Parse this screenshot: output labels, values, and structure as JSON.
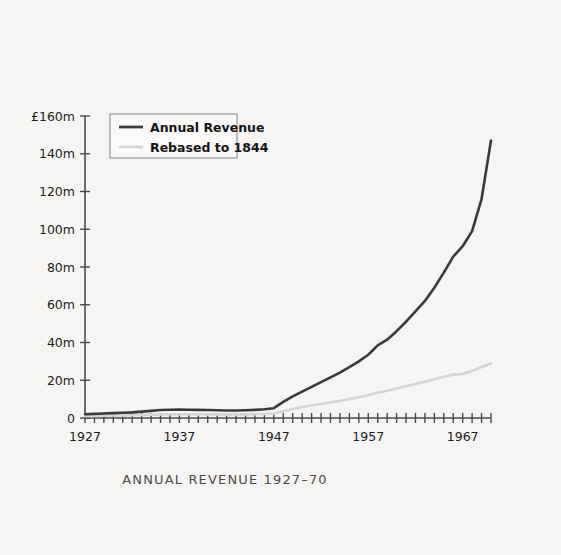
{
  "chart_data": {
    "type": "line",
    "title": "ANNUAL REVENUE 1927–70",
    "xlabel": "",
    "ylabel": "",
    "ylim": [
      0,
      160
    ],
    "xlim": [
      1927,
      1970
    ],
    "grid": false,
    "legend_position": "top-left",
    "y_unit": "£m",
    "y_ticks": [
      0,
      20,
      40,
      60,
      80,
      100,
      120,
      140,
      160
    ],
    "y_tick_labels": [
      "0",
      "20m",
      "40m",
      "60m",
      "80m",
      "100m",
      "120m",
      "140m",
      "£160m"
    ],
    "x_ticks_all_years": true,
    "x_tick_labels": [
      "1927",
      "1937",
      "1947",
      "1957",
      "1967"
    ],
    "x_tick_label_years": [
      1927,
      1937,
      1947,
      1957,
      1967
    ],
    "x": [
      1927,
      1928,
      1929,
      1930,
      1931,
      1932,
      1933,
      1934,
      1935,
      1936,
      1937,
      1938,
      1939,
      1940,
      1941,
      1942,
      1943,
      1944,
      1945,
      1946,
      1947,
      1948,
      1949,
      1950,
      1951,
      1952,
      1953,
      1954,
      1955,
      1956,
      1957,
      1958,
      1959,
      1960,
      1961,
      1962,
      1963,
      1964,
      1965,
      1966,
      1967,
      1968,
      1969,
      1970
    ],
    "series": [
      {
        "name": "Annual Revenue",
        "color": "#3a3a3c",
        "values": [
          2.0,
          2.2,
          2.4,
          2.6,
          2.8,
          3.0,
          3.4,
          3.8,
          4.2,
          4.4,
          4.5,
          4.4,
          4.3,
          4.2,
          4.1,
          4.0,
          4.0,
          4.1,
          4.3,
          4.6,
          5.2,
          8.5,
          11.5,
          14.0,
          16.5,
          19.0,
          21.5,
          24.0,
          27.0,
          30.0,
          33.5,
          38.5,
          41.5,
          46.0,
          51.0,
          56.5,
          62.0,
          69.0,
          77.0,
          85.5,
          91.0,
          99.0,
          116.0,
          147.0
        ]
      },
      {
        "name": "Rebased to 1844",
        "color": "#d5d5d3",
        "values": [
          1.0,
          1.1,
          1.2,
          1.3,
          1.4,
          1.5,
          1.6,
          1.8,
          1.9,
          2.0,
          2.0,
          2.0,
          1.9,
          1.9,
          1.9,
          1.8,
          1.8,
          1.9,
          2.0,
          2.1,
          2.4,
          3.6,
          4.8,
          5.8,
          6.6,
          7.4,
          8.2,
          9.0,
          10.0,
          11.0,
          12.0,
          13.4,
          14.4,
          15.6,
          16.8,
          18.0,
          19.2,
          20.5,
          21.8,
          23.0,
          23.3,
          25.0,
          27.0,
          29.0
        ]
      }
    ],
    "legend": [
      {
        "label": "Annual Revenue",
        "color": "#3a3a3c"
      },
      {
        "label": "Rebased to 1844",
        "color": "#d5d5d3"
      }
    ]
  },
  "page": {
    "background_color": "#f6f5f3",
    "axis_color": "#4a4a4a",
    "text_color": "#1c1c1c",
    "caption_color": "#4b4b4b"
  }
}
